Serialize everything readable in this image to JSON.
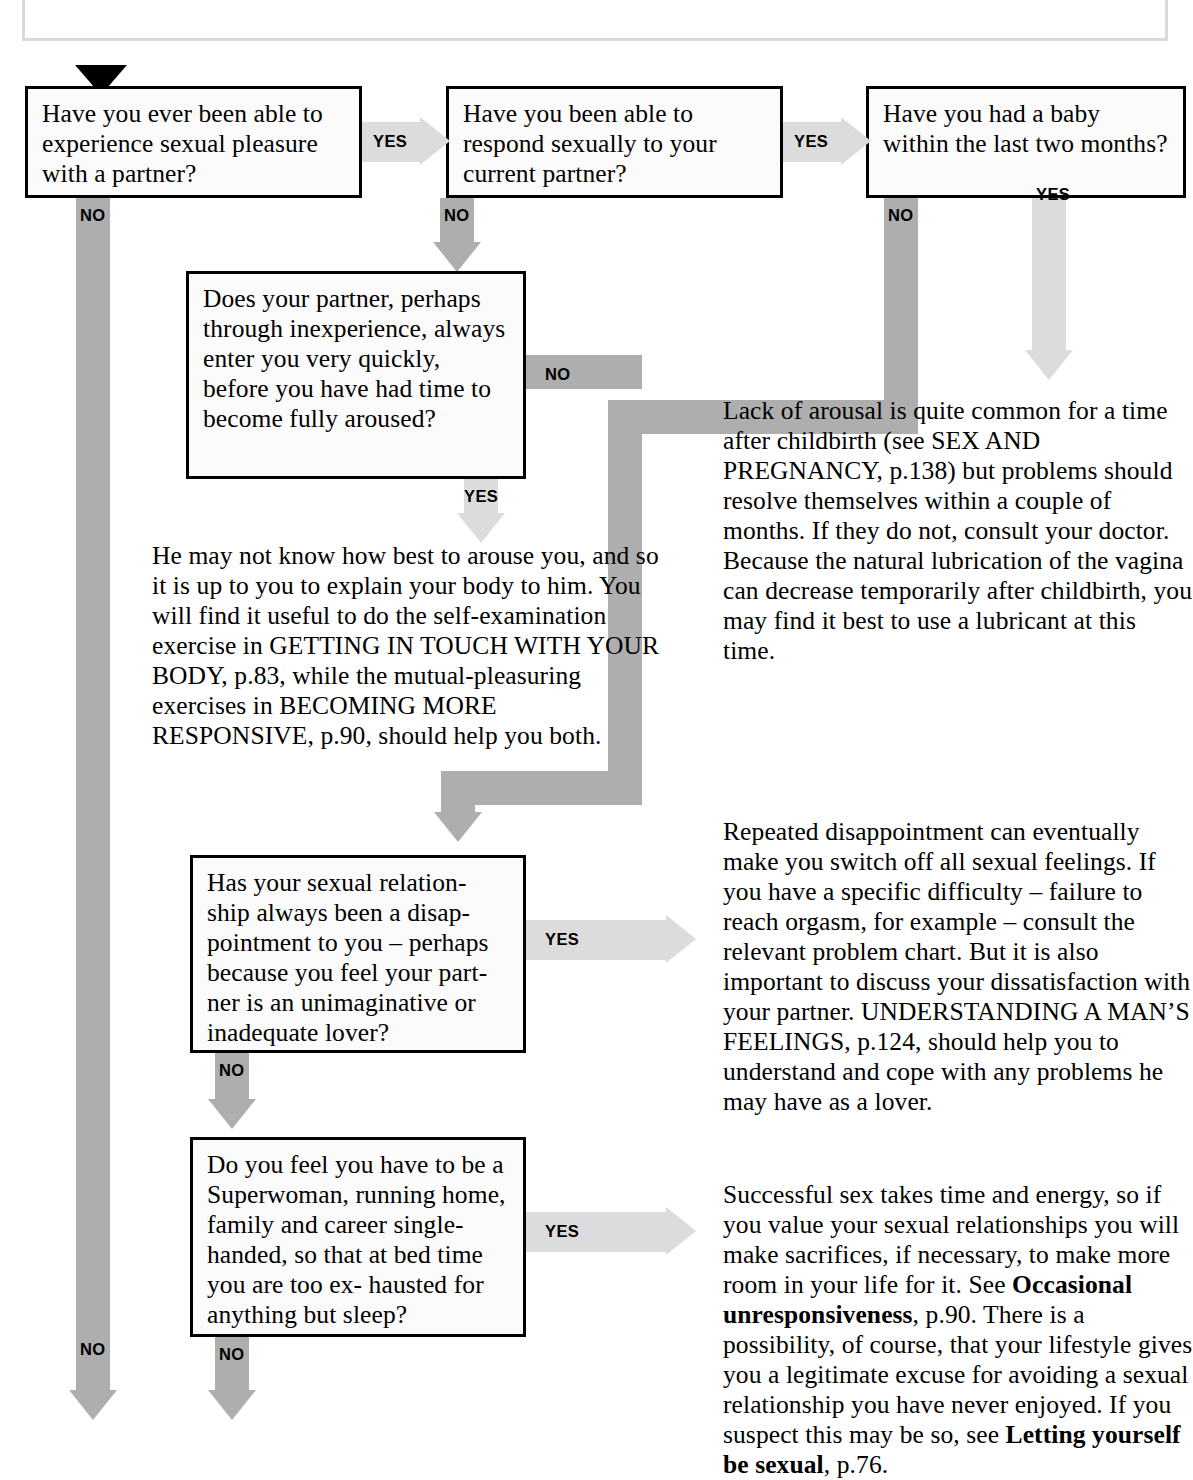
{
  "chart_type": "flowchart",
  "start": {
    "marker": "black-down-triangle"
  },
  "boxes": [
    {
      "id": "q1",
      "text": "Have you ever been able to experience sexual pleasure with a partner?"
    },
    {
      "id": "q2",
      "text": "Have you been able to respond sexually to your current partner?"
    },
    {
      "id": "q3",
      "text": "Have you had a baby within the last two months?"
    },
    {
      "id": "q4",
      "text": "Does your partner, perhaps through inexperience, always enter you very quickly, before you have had time to become fully aroused?"
    },
    {
      "id": "q5",
      "text": "Has your sexual relation- ship always been a disap- pointment to you – perhaps because you feel your part- ner is an unimaginative or inadequate lover?"
    },
    {
      "id": "q6",
      "text": "Do you feel you have to be a Superwoman, running home, family and career single-handed, so that at bed time you are too ex- hausted for anything but sleep?"
    }
  ],
  "answers": [
    {
      "id": "a1",
      "text": "He may not know how best to arouse you, and so it is up to you to explain your body to him. You will find it useful to do the self-examination exercise in GETTING IN TOUCH WITH YOUR BODY, p.83, while the mutual-pleasuring exercises in BECOMING MORE RESPONSIVE, p.90, should help you both."
    },
    {
      "id": "a2",
      "text": "Lack of arousal is quite common for a time after childbirth (see SEX AND PREGNANCY, p.138) but problems should resolve themselves within a couple of months. If they do not, consult your doctor. Because the natural lubrication of the vagina can decrease temporarily after childbirth, you may find it best to use a lubricant at this time."
    },
    {
      "id": "a3",
      "text": "Repeated disappointment can eventually make you switch off all sexual feelings. If you have a specific difficulty – failure to reach orgasm, for example – consult the relevant problem chart. But it is also important to discuss your dissatisfaction with your partner. UNDERSTANDING A MAN’S FEELINGS, p.124, should help you to understand and cope with any problems he may have as a lover."
    },
    {
      "id": "a4_part1",
      "text": "Successful sex takes time and energy, so if you value your sexual relationships you will make sacrifices, if necessary, to make more room in your life for it. See "
    },
    {
      "id": "a4_bold1",
      "text": "Occasional unresponsiveness"
    },
    {
      "id": "a4_part2",
      "text": ", p.90. There is a possibility, of course, that your lifestyle gives you a legitimate excuse for avoiding a sexual relationship you have never enjoyed. If you suspect this may be so, see "
    },
    {
      "id": "a4_bold2",
      "text": "Letting yourself be sexual"
    },
    {
      "id": "a4_part3",
      "text": ", p.76."
    }
  ],
  "edge_labels": {
    "yes": "YES",
    "no": "NO",
    "q1_no": "NO",
    "q1_yes": "YES",
    "q2_no": "NO",
    "q2_yes": "YES",
    "q3_no": "NO",
    "q3_yes": "YES",
    "q4_no": "NO",
    "q4_yes": "YES",
    "q5_no": "NO",
    "q5_yes": "YES",
    "q6_no": "NO",
    "q6_yes": "YES",
    "q1_no_bottom": "NO",
    "q6_no_bottom": "NO"
  },
  "colors": {
    "arrow_no": "#aeaeae",
    "arrow_yes": "#dcdcdc",
    "box_border": "#000000",
    "box_fill": "#fbfbfb",
    "text": "#000000",
    "frame": "#d9d9d9"
  }
}
